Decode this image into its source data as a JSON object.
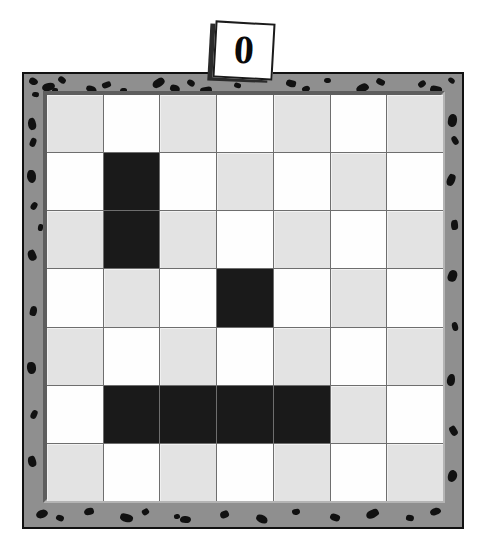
{
  "puzzle": {
    "title": "Nonogram board",
    "clue_tag": {
      "value": "0",
      "icon": "clue-card"
    },
    "board": {
      "columns": 7,
      "rows": 7,
      "colors": {
        "light_cell": "#e3e3e3",
        "white_cell": "#fefefe",
        "filled_cell": "#1a1a1a",
        "frame": "#8f8f8f",
        "frame_speckle": "#111111",
        "grid_line": "#6e6e6e"
      },
      "legend": {
        "filled": "filled",
        "light": "light",
        "white": "white"
      },
      "cells": [
        [
          "light",
          "white",
          "light",
          "white",
          "light",
          "white",
          "light"
        ],
        [
          "white",
          "filled",
          "white",
          "light",
          "white",
          "light",
          "white"
        ],
        [
          "light",
          "filled",
          "light",
          "white",
          "light",
          "white",
          "light"
        ],
        [
          "white",
          "light",
          "white",
          "filled",
          "white",
          "light",
          "white"
        ],
        [
          "light",
          "white",
          "light",
          "white",
          "light",
          "white",
          "light"
        ],
        [
          "white",
          "filled",
          "filled",
          "filled",
          "filled",
          "light",
          "white"
        ],
        [
          "light",
          "white",
          "light",
          "white",
          "light",
          "white",
          "light"
        ]
      ]
    },
    "frame_speckles": [
      {
        "x": 5,
        "y": 4,
        "w": 9,
        "h": 7,
        "r": 22
      },
      {
        "x": 18,
        "y": 9,
        "w": 13,
        "h": 8,
        "r": -14
      },
      {
        "x": 34,
        "y": 3,
        "w": 8,
        "h": 6,
        "r": 40
      },
      {
        "x": 8,
        "y": 18,
        "w": 7,
        "h": 5,
        "r": 10
      },
      {
        "x": 62,
        "y": 12,
        "w": 11,
        "h": 7,
        "r": 25
      },
      {
        "x": 78,
        "y": 8,
        "w": 9,
        "h": 6,
        "r": -20
      },
      {
        "x": 96,
        "y": 14,
        "w": 7,
        "h": 5,
        "r": 5
      },
      {
        "x": 128,
        "y": 5,
        "w": 13,
        "h": 8,
        "r": -30
      },
      {
        "x": 146,
        "y": 11,
        "w": 10,
        "h": 7,
        "r": 18
      },
      {
        "x": 163,
        "y": 6,
        "w": 8,
        "h": 6,
        "r": 33
      },
      {
        "x": 176,
        "y": 13,
        "w": 12,
        "h": 7,
        "r": -10
      },
      {
        "x": 262,
        "y": 6,
        "w": 10,
        "h": 7,
        "r": 15
      },
      {
        "x": 278,
        "y": 12,
        "w": 8,
        "h": 6,
        "r": -25
      },
      {
        "x": 300,
        "y": 4,
        "w": 7,
        "h": 5,
        "r": 8
      },
      {
        "x": 332,
        "y": 10,
        "w": 13,
        "h": 8,
        "r": -18
      },
      {
        "x": 352,
        "y": 5,
        "w": 9,
        "h": 6,
        "r": 28
      },
      {
        "x": 394,
        "y": 7,
        "w": 8,
        "h": 6,
        "r": -35
      },
      {
        "x": 406,
        "y": 12,
        "w": 12,
        "h": 8,
        "r": 12
      },
      {
        "x": 424,
        "y": 4,
        "w": 7,
        "h": 5,
        "r": 40
      },
      {
        "x": 4,
        "y": 44,
        "w": 8,
        "h": 12,
        "r": -12
      },
      {
        "x": 6,
        "y": 64,
        "w": 6,
        "h": 9,
        "r": 20
      },
      {
        "x": 3,
        "y": 96,
        "w": 9,
        "h": 13,
        "r": -5
      },
      {
        "x": 7,
        "y": 128,
        "w": 6,
        "h": 8,
        "r": 30
      },
      {
        "x": 4,
        "y": 176,
        "w": 8,
        "h": 11,
        "r": -22
      },
      {
        "x": 6,
        "y": 232,
        "w": 7,
        "h": 10,
        "r": 14
      },
      {
        "x": 3,
        "y": 288,
        "w": 9,
        "h": 12,
        "r": -8
      },
      {
        "x": 7,
        "y": 336,
        "w": 6,
        "h": 9,
        "r": 25
      },
      {
        "x": 4,
        "y": 382,
        "w": 8,
        "h": 11,
        "r": -16
      },
      {
        "x": 424,
        "y": 40,
        "w": 9,
        "h": 13,
        "r": 10
      },
      {
        "x": 428,
        "y": 62,
        "w": 6,
        "h": 9,
        "r": -28
      },
      {
        "x": 423,
        "y": 100,
        "w": 8,
        "h": 12,
        "r": 18
      },
      {
        "x": 427,
        "y": 146,
        "w": 7,
        "h": 10,
        "r": -6
      },
      {
        "x": 424,
        "y": 196,
        "w": 9,
        "h": 12,
        "r": 22
      },
      {
        "x": 428,
        "y": 248,
        "w": 6,
        "h": 9,
        "r": -14
      },
      {
        "x": 423,
        "y": 300,
        "w": 8,
        "h": 12,
        "r": 8
      },
      {
        "x": 426,
        "y": 352,
        "w": 7,
        "h": 10,
        "r": -30
      },
      {
        "x": 424,
        "y": 396,
        "w": 9,
        "h": 12,
        "r": 16
      },
      {
        "x": 12,
        "y": 436,
        "w": 12,
        "h": 8,
        "r": -18
      },
      {
        "x": 32,
        "y": 441,
        "w": 8,
        "h": 6,
        "r": 24
      },
      {
        "x": 60,
        "y": 434,
        "w": 10,
        "h": 7,
        "r": -8
      },
      {
        "x": 96,
        "y": 440,
        "w": 13,
        "h": 8,
        "r": 14
      },
      {
        "x": 118,
        "y": 435,
        "w": 7,
        "h": 6,
        "r": -32
      },
      {
        "x": 156,
        "y": 442,
        "w": 11,
        "h": 7,
        "r": 6
      },
      {
        "x": 196,
        "y": 437,
        "w": 9,
        "h": 7,
        "r": -20
      },
      {
        "x": 232,
        "y": 441,
        "w": 12,
        "h": 8,
        "r": 26
      },
      {
        "x": 268,
        "y": 435,
        "w": 8,
        "h": 6,
        "r": -10
      },
      {
        "x": 306,
        "y": 440,
        "w": 10,
        "h": 7,
        "r": 20
      },
      {
        "x": 342,
        "y": 436,
        "w": 13,
        "h": 8,
        "r": -24
      },
      {
        "x": 382,
        "y": 441,
        "w": 8,
        "h": 6,
        "r": 12
      },
      {
        "x": 406,
        "y": 434,
        "w": 11,
        "h": 7,
        "r": -16
      },
      {
        "x": 28,
        "y": 14,
        "w": 6,
        "h": 5,
        "r": 0
      },
      {
        "x": 210,
        "y": 9,
        "w": 7,
        "h": 5,
        "r": 18
      },
      {
        "x": 150,
        "y": 440,
        "w": 6,
        "h": 5,
        "r": -12
      },
      {
        "x": 14,
        "y": 150,
        "w": 5,
        "h": 7,
        "r": 10
      }
    ]
  }
}
